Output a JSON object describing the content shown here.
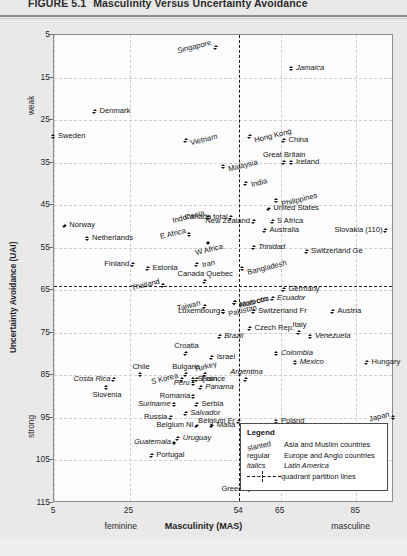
{
  "figure": {
    "number": "FIGURE 5.1",
    "title": "Masculinity Versus Uncertainty Avoidance"
  },
  "legend": {
    "heading": "Legend",
    "entries": [
      {
        "key": "slanted",
        "desc": "Asia and Muslim countries",
        "style": "slanted"
      },
      {
        "key": "regular",
        "desc": "Europe and Anglo countries",
        "style": "regular"
      },
      {
        "key": "italics",
        "desc": "Latin America",
        "style": "italics"
      },
      {
        "key": "line",
        "desc": "quadrant partition lines",
        "style": "line"
      }
    ]
  },
  "chart_data": {
    "type": "scatter",
    "title": "Masculinity Versus Uncertainty Avoidance",
    "xlabel": "Masculinity (MAS)",
    "ylabel": "Uncertainty Avoidance (UAI)",
    "xlim": [
      5,
      95
    ],
    "ylim": [
      5,
      115
    ],
    "y_inverted": true,
    "grid": true,
    "xticks": [
      5,
      25,
      54,
      65,
      85
    ],
    "yticks": [
      5,
      15,
      25,
      35,
      45,
      55,
      65,
      75,
      85,
      95,
      105,
      115
    ],
    "x_axis_low_label": "feminine",
    "x_axis_high_label": "masculine",
    "y_axis_low_label": "weak",
    "y_axis_high_label": "strong",
    "partition_x": 54,
    "partition_y": 64,
    "series_styles": {
      "slanted": "Asia and Muslim countries",
      "regular": "Europe and Anglo countries",
      "italics": "Latin America"
    },
    "points": [
      {
        "label": "Singapore",
        "x": 48,
        "y": 8,
        "style": "slanted",
        "lp": "left"
      },
      {
        "label": "Jamaica",
        "x": 68,
        "y": 13,
        "style": "italics",
        "lp": "right"
      },
      {
        "label": "Denmark",
        "x": 16,
        "y": 23,
        "style": "regular",
        "lp": "right"
      },
      {
        "label": "Sweden",
        "x": 5,
        "y": 29,
        "style": "regular",
        "lp": "right"
      },
      {
        "label": "Vietnam",
        "x": 40,
        "y": 30,
        "style": "slanted",
        "lp": "right"
      },
      {
        "label": "Hong Kong",
        "x": 57,
        "y": 29,
        "style": "slanted",
        "lp": "right"
      },
      {
        "label": "China",
        "x": 66,
        "y": 30,
        "style": "regular",
        "lp": "right"
      },
      {
        "label": "Great Britain",
        "x": 66,
        "y": 35,
        "style": "regular",
        "lp": "above"
      },
      {
        "label": "Ireland",
        "x": 68,
        "y": 35,
        "style": "regular",
        "lp": "right"
      },
      {
        "label": "Malaysia",
        "x": 50,
        "y": 36,
        "style": "slanted",
        "lp": "right"
      },
      {
        "label": "India",
        "x": 56,
        "y": 40,
        "style": "slanted",
        "lp": "right"
      },
      {
        "label": "Philippines",
        "x": 64,
        "y": 44,
        "style": "slanted",
        "lp": "right"
      },
      {
        "label": "Canada total",
        "x": 52,
        "y": 48,
        "style": "regular",
        "lp": "left"
      },
      {
        "label": "United States",
        "x": 62,
        "y": 46,
        "style": "regular",
        "lp": "right"
      },
      {
        "label": "Indonesia",
        "x": 46,
        "y": 48,
        "style": "slanted",
        "lp": "left"
      },
      {
        "label": "Norway",
        "x": 8,
        "y": 50,
        "style": "regular",
        "lp": "right"
      },
      {
        "label": "S Africa",
        "x": 63,
        "y": 49,
        "style": "regular",
        "lp": "right"
      },
      {
        "label": "Slovakia (110)",
        "x": 93,
        "y": 51,
        "style": "regular",
        "lp": "left"
      },
      {
        "label": "New Zealand",
        "x": 58,
        "y": 49,
        "style": "regular",
        "lp": "left"
      },
      {
        "label": "Australia",
        "x": 61,
        "y": 51,
        "style": "regular",
        "lp": "right"
      },
      {
        "label": "Netherlands",
        "x": 14,
        "y": 53,
        "style": "regular",
        "lp": "right"
      },
      {
        "label": "E Africa",
        "x": 41,
        "y": 52,
        "style": "slanted",
        "lp": "left"
      },
      {
        "label": "W Africa",
        "x": 46,
        "y": 54,
        "style": "slanted",
        "lp": "below"
      },
      {
        "label": "Trinidad",
        "x": 58,
        "y": 55,
        "style": "italics",
        "lp": "right"
      },
      {
        "label": "Switzerland Ge",
        "x": 72,
        "y": 56,
        "style": "regular",
        "lp": "right"
      },
      {
        "label": "Finland",
        "x": 26,
        "y": 59,
        "style": "regular",
        "lp": "left"
      },
      {
        "label": "Estonia",
        "x": 30,
        "y": 60,
        "style": "right-of"
      },
      {
        "label": "Iran",
        "x": 43,
        "y": 59,
        "style": "slanted",
        "lp": "right"
      },
      {
        "label": "Bangladesh",
        "x": 55,
        "y": 60,
        "style": "slanted",
        "lp": "right"
      },
      {
        "label": "Canada Quebec",
        "x": 45,
        "y": 63,
        "style": "regular",
        "lp": "above"
      },
      {
        "label": "Thailand",
        "x": 34,
        "y": 64,
        "style": "slanted",
        "lp": "left"
      },
      {
        "label": "Arab ctrs.",
        "x": 53,
        "y": 68,
        "style": "slanted",
        "lp": "right"
      },
      {
        "label": "Morocco",
        "x": 53,
        "y": 68,
        "style": "slanted",
        "lp": "right"
      },
      {
        "label": "Germany",
        "x": 66,
        "y": 65,
        "style": "regular",
        "lp": "right"
      },
      {
        "label": "Ecuador",
        "x": 63,
        "y": 67,
        "style": "italics",
        "lp": "right"
      },
      {
        "label": "Taiwan",
        "x": 45,
        "y": 69,
        "style": "slanted",
        "lp": "left"
      },
      {
        "label": "Switzerland Fr",
        "x": 58,
        "y": 70,
        "style": "regular",
        "lp": "right"
      },
      {
        "label": "Austria",
        "x": 79,
        "y": 70,
        "style": "regular",
        "lp": "right"
      },
      {
        "label": "Luxembourg",
        "x": 50,
        "y": 70,
        "style": "regular",
        "lp": "left"
      },
      {
        "label": "Pakistan",
        "x": 50,
        "y": 70,
        "style": "slanted",
        "lp": "right"
      },
      {
        "label": "Czech Rep.",
        "x": 57,
        "y": 74,
        "style": "regular",
        "lp": "right"
      },
      {
        "label": "Italy",
        "x": 70,
        "y": 75,
        "style": "regular",
        "lp": "above"
      },
      {
        "label": "Brazil",
        "x": 49,
        "y": 76,
        "style": "italics",
        "lp": "right"
      },
      {
        "label": "Venezuela",
        "x": 73,
        "y": 76,
        "style": "italics",
        "lp": "right"
      },
      {
        "label": "Croatia",
        "x": 40,
        "y": 80,
        "style": "regular",
        "lp": "above"
      },
      {
        "label": "Israel",
        "x": 47,
        "y": 81,
        "style": "above"
      },
      {
        "label": "Colombia",
        "x": 64,
        "y": 80,
        "style": "italics",
        "lp": "right"
      },
      {
        "label": "Hungary",
        "x": 88,
        "y": 82,
        "style": "regular",
        "lp": "right"
      },
      {
        "label": "Mexico",
        "x": 69,
        "y": 82,
        "style": "italics",
        "lp": "right"
      },
      {
        "label": "Costa Rica",
        "x": 21,
        "y": 86,
        "style": "italics",
        "lp": "left"
      },
      {
        "label": "Chile",
        "x": 28,
        "y": 85,
        "style": "regular",
        "lp": "above"
      },
      {
        "label": "Bulgaria",
        "x": 40,
        "y": 85,
        "style": "regular",
        "lp": "above"
      },
      {
        "label": "Turkey",
        "x": 45,
        "y": 85,
        "style": "slanted",
        "lp": "above"
      },
      {
        "label": "S Korea",
        "x": 39,
        "y": 86,
        "style": "slanted",
        "lp": "left"
      },
      {
        "label": "France",
        "x": 43,
        "y": 86,
        "style": "regular",
        "lp": "right"
      },
      {
        "label": "Spain",
        "x": 42,
        "y": 86,
        "style": "right"
      },
      {
        "label": "Peru",
        "x": 42,
        "y": 87,
        "style": "italics",
        "lp": "left"
      },
      {
        "label": "Argentina",
        "x": 56,
        "y": 86,
        "style": "italics",
        "lp": "above"
      },
      {
        "label": "Slovenia",
        "x": 19,
        "y": 88,
        "style": "regular",
        "lp": "below"
      },
      {
        "label": "Panama",
        "x": 44,
        "y": 88,
        "style": "italics",
        "lp": "right"
      },
      {
        "label": "Romania",
        "x": 42,
        "y": 90,
        "style": "regular",
        "lp": "left"
      },
      {
        "label": "Suriname",
        "x": 37,
        "y": 92,
        "style": "italics",
        "lp": "left"
      },
      {
        "label": "Serbia",
        "x": 43,
        "y": 92,
        "style": "regular",
        "lp": "right"
      },
      {
        "label": "Salvador",
        "x": 40,
        "y": 94,
        "style": "italics",
        "lp": "right"
      },
      {
        "label": "Russia",
        "x": 36,
        "y": 95,
        "style": "regular",
        "lp": "left"
      },
      {
        "label": "Belgium Fr",
        "x": 54,
        "y": 96,
        "style": "regular",
        "lp": "left"
      },
      {
        "label": "Poland",
        "x": 64,
        "y": 96,
        "style": "regular",
        "lp": "right"
      },
      {
        "label": "Japan",
        "x": 95,
        "y": 95,
        "style": "slanted",
        "lp": "left"
      },
      {
        "label": "Belgium Nl",
        "x": 43,
        "y": 97,
        "style": "regular",
        "lp": "left"
      },
      {
        "label": "Malta",
        "x": 47,
        "y": 97,
        "style": "regular",
        "lp": "right"
      },
      {
        "label": "Guatemala",
        "x": 37,
        "y": 101,
        "style": "italics",
        "lp": "left"
      },
      {
        "label": "Uruguay",
        "x": 38,
        "y": 100,
        "style": "italics",
        "lp": "right"
      },
      {
        "label": "Portugal",
        "x": 31,
        "y": 104,
        "style": "regular",
        "lp": "right"
      },
      {
        "label": "Greece",
        "x": 57,
        "y": 112,
        "style": "regular",
        "lp": "left"
      }
    ]
  }
}
